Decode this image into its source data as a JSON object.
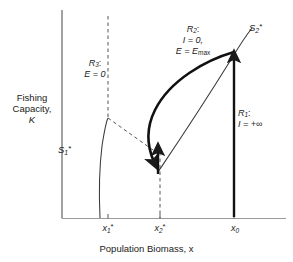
{
  "figure": {
    "type": "phase-diagram",
    "background_color": "#ffffff",
    "line_color": "#1a1a1a"
  },
  "axes": {
    "x_title": "Population Biomass, x",
    "y_title_line1": "Fishing",
    "y_title_line2": "Capacity,",
    "y_title_line3": "K",
    "x_ticks": [
      {
        "name": "x1-star",
        "label_base": "x",
        "label_sub": "1",
        "label_sup": "*"
      },
      {
        "name": "x2-star",
        "label_base": "x",
        "label_sub": "2",
        "label_sup": "*"
      },
      {
        "name": "x0",
        "label_base": "x",
        "label_sub": "0",
        "label_sup": ""
      }
    ]
  },
  "regions": [
    {
      "id": "R1",
      "line1": "R",
      "line1_sub": "1",
      "line1_suffix": ":",
      "line2": "I = +∞"
    },
    {
      "id": "R2",
      "line1": "R",
      "line1_sub": "2",
      "line1_suffix": ":",
      "line2": "I = 0,",
      "line3_base": "E = E",
      "line3_sub": "max"
    },
    {
      "id": "R3",
      "line1": "R",
      "line1_sub": "3",
      "line1_suffix": ":",
      "line2": "E = 0"
    }
  ],
  "curves": [
    {
      "id": "S1",
      "label_base": "S",
      "label_sub": "1",
      "label_sup": "*",
      "style": "thin-solid"
    },
    {
      "id": "S2",
      "label_base": "S",
      "label_sub": "2",
      "label_sup": "*",
      "style": "thin-solid"
    },
    {
      "id": "trajectory-upper",
      "style": "thick-solid-arrow-down"
    },
    {
      "id": "trajectory-lower",
      "style": "thin-solid"
    },
    {
      "id": "trajectory-vertical-x0",
      "style": "thick-solid-arrow-up"
    },
    {
      "id": "trajectory-vertical-x2",
      "style": "thick-solid-arrow-up"
    },
    {
      "id": "boundary-x1",
      "style": "dashed-vertical"
    },
    {
      "id": "boundary-x2",
      "style": "dashed-vertical"
    },
    {
      "id": "boundary-diagonal",
      "style": "dashed-diagonal"
    }
  ]
}
